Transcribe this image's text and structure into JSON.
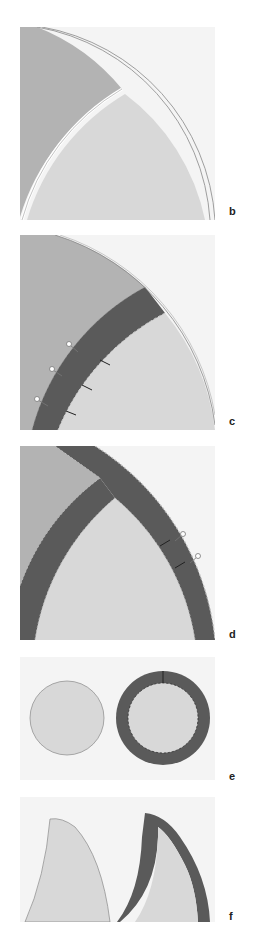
{
  "figure": {
    "panels": [
      {
        "id": "b",
        "label": "b",
        "description": "Quarter-circle pattern piece with curved seam dividing darker outer region and lighter inner region"
      },
      {
        "id": "c",
        "label": "c",
        "description": "Dark bias strip pinned along curved seam with stitch marks"
      },
      {
        "id": "d",
        "label": "d",
        "description": "Two crossing dark bias strips with zigzag edges, pins on outer edge"
      },
      {
        "id": "e",
        "label": "e",
        "description": "Plain light circle beside circle bound with dark ring"
      },
      {
        "id": "f",
        "label": "f",
        "description": "Plain curved shape beside same shape bound with dark strip"
      }
    ]
  },
  "colors": {
    "background": "#ffffff",
    "panel_bg": "#f4f4f4",
    "fabric_dark": "#b3b3b3",
    "fabric_light": "#d8d8d8",
    "binding": "#5a5a5a",
    "pin": "#ffffff",
    "outline": "#8a8a8a"
  }
}
